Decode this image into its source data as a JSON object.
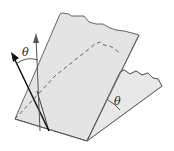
{
  "diagram": {
    "labels": {
      "normal_angle": "θ",
      "plane_angle": "θ"
    },
    "colors": {
      "plane_fill": "#e4e4e4",
      "plane_edge": "#555555",
      "arrow": "#222222",
      "dashed": "#555555"
    }
  }
}
